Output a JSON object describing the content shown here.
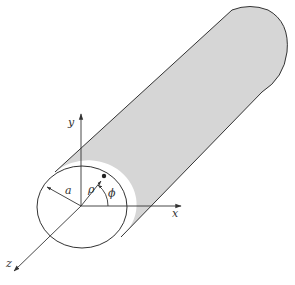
{
  "diagram": {
    "type": "cylindrical-coordinates",
    "colors": {
      "stroke": "#333333",
      "cylinder_fill": "#d6d6d6",
      "face_fill": "#ffffff",
      "background": "#ffffff"
    },
    "labels": {
      "x_axis": "x",
      "y_axis": "y",
      "z_axis": "z",
      "radius": "a",
      "rho": "ρ",
      "phi": "ϕ"
    }
  }
}
